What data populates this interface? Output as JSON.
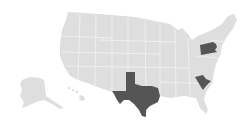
{
  "map": {
    "type": "us-states-choropleth",
    "colors": {
      "background": "#ffffff",
      "default_state": "#dedede",
      "state_border": "#f2f2f2",
      "highlighted_state": "#555555"
    },
    "highlighted_states": [
      {
        "name": "Texas",
        "abbr": "TX"
      },
      {
        "name": "Pennsylvania",
        "abbr": "PA"
      },
      {
        "name": "South Carolina",
        "abbr": "SC"
      }
    ]
  }
}
